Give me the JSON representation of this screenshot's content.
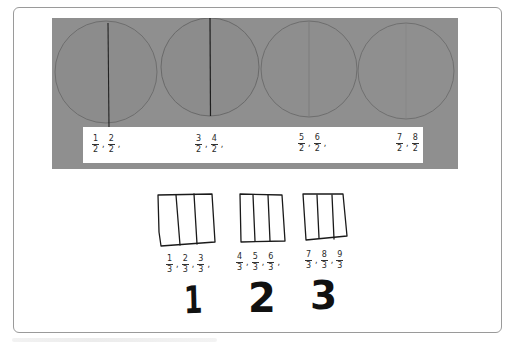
{
  "figure": {
    "top_panel": {
      "description": "Photo of four paper circles, each folded/cut in half, with fraction labels",
      "background_color": "#8f8f8f",
      "circles": [
        {
          "index": 1,
          "divided_into": 2,
          "divider": "dark"
        },
        {
          "index": 2,
          "divided_into": 2,
          "divider": "dark"
        },
        {
          "index": 3,
          "divided_into": 2,
          "divider": "faint"
        },
        {
          "index": 4,
          "divided_into": 2,
          "divider": "very faint"
        }
      ],
      "label_strip": {
        "groups": [
          {
            "fractions": [
              {
                "num": "1",
                "den": "2"
              },
              {
                "num": "2",
                "den": "2"
              }
            ],
            "separators": [
              ",",
              ","
            ]
          },
          {
            "fractions": [
              {
                "num": "3",
                "den": "2"
              },
              {
                "num": "4",
                "den": "2"
              }
            ],
            "separators": [
              ",",
              ","
            ]
          },
          {
            "fractions": [
              {
                "num": "5",
                "den": "2"
              },
              {
                "num": "6",
                "den": "2"
              }
            ],
            "separators": [
              ",",
              ","
            ]
          },
          {
            "fractions": [
              {
                "num": "7",
                "den": "2"
              },
              {
                "num": "8",
                "den": "2"
              }
            ],
            "separators": [
              ","
            ]
          }
        ]
      }
    },
    "bottom_panel": {
      "description": "Hand-drawn rectangles divided into thirds with fraction labels and whole-number totals",
      "wholes": [
        {
          "divided_into": 3,
          "fractions": [
            {
              "num": "1",
              "den": "3"
            },
            {
              "num": "2",
              "den": "3"
            },
            {
              "num": "3",
              "den": "3"
            }
          ],
          "separators": [
            ",",
            ",",
            ","
          ],
          "whole_number": "1"
        },
        {
          "divided_into": 3,
          "fractions": [
            {
              "num": "4",
              "den": "3"
            },
            {
              "num": "5",
              "den": "3"
            },
            {
              "num": "6",
              "den": "3"
            }
          ],
          "separators": [
            ",",
            ",",
            ","
          ],
          "whole_number": "2"
        },
        {
          "divided_into": 3,
          "fractions": [
            {
              "num": "7",
              "den": "3"
            },
            {
              "num": "8",
              "den": "3"
            },
            {
              "num": "9",
              "den": "3"
            }
          ],
          "separators": [
            ",",
            ","
          ],
          "whole_number": "3"
        }
      ]
    }
  },
  "colors": {
    "card_border": "#9a9a9a",
    "photo_gray": "#8f8f8f",
    "ink": "#111111"
  }
}
